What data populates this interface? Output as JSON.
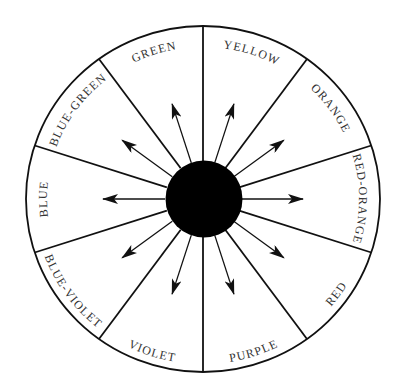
{
  "diagram": {
    "title": "",
    "center_hub": {
      "color": "#000000"
    },
    "line_color": "#111111",
    "label_color": "#333333",
    "sectors": [
      {
        "label": "RED-ORANGE",
        "angle_deg": 0
      },
      {
        "label": "ORANGE",
        "angle_deg": 36
      },
      {
        "label": "YELLOW",
        "angle_deg": 72
      },
      {
        "label": "GREEN",
        "angle_deg": 108
      },
      {
        "label": "BLUE-GREEN",
        "angle_deg": 144
      },
      {
        "label": "BLUE",
        "angle_deg": 180
      },
      {
        "label": "BLUE-VIOLET",
        "angle_deg": 216
      },
      {
        "label": "VIOLET",
        "angle_deg": 252
      },
      {
        "label": "PURPLE",
        "angle_deg": 288
      },
      {
        "label": "RED",
        "angle_deg": 324
      }
    ],
    "arrow_count": 10,
    "divider_count": 10
  }
}
